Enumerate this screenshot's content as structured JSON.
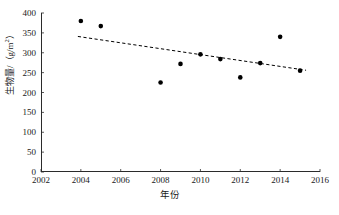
{
  "chart_data": {
    "type": "scatter",
    "title": "",
    "subtitle": "",
    "xlabel": "年份",
    "ylabel": "生物量/（g/m²）",
    "ylabel_parts": {
      "text": "生物量/（g/m",
      "superscript": "2",
      "tail": "）"
    },
    "xlim": [
      2002,
      2016
    ],
    "ylim": [
      0,
      400
    ],
    "xticks": [
      2002,
      2004,
      2006,
      2008,
      2010,
      2012,
      2014,
      2016
    ],
    "xtick_labels": [
      "2002",
      "2004",
      "2006",
      "2008",
      "2010",
      "2012",
      "2014",
      "2016"
    ],
    "yticks": [
      0,
      50,
      100,
      150,
      200,
      250,
      300,
      350,
      400
    ],
    "ytick_labels": [
      "0",
      "50",
      "100",
      "150",
      "200",
      "250",
      "300",
      "350",
      "400"
    ],
    "grid": false,
    "legend": null,
    "marker": {
      "shape": "circle",
      "color": "#000000",
      "size_px": 4.6
    },
    "x": [
      2004,
      2005,
      2008,
      2009,
      2010,
      2011,
      2012,
      2013,
      2014,
      2015
    ],
    "y": [
      380,
      367,
      225,
      272,
      296,
      284,
      238,
      274,
      340,
      255
    ],
    "points": [
      {
        "x": 2004,
        "y": 380
      },
      {
        "x": 2005,
        "y": 367
      },
      {
        "x": 2008,
        "y": 225
      },
      {
        "x": 2009,
        "y": 272
      },
      {
        "x": 2010,
        "y": 296
      },
      {
        "x": 2011,
        "y": 284
      },
      {
        "x": 2012,
        "y": 238
      },
      {
        "x": 2013,
        "y": 274
      },
      {
        "x": 2014,
        "y": 340
      },
      {
        "x": 2015,
        "y": 255
      }
    ],
    "series": [
      {
        "name": "生物量",
        "type": "scatter",
        "values": [
          380,
          367,
          225,
          272,
          296,
          284,
          238,
          274,
          340,
          255
        ]
      },
      {
        "name": "trendline",
        "type": "line",
        "style": "dashed",
        "color": "#000000",
        "x_start": 2003.85,
        "y_start": 341,
        "x_end": 2015.3,
        "y_end": 256
      }
    ]
  }
}
